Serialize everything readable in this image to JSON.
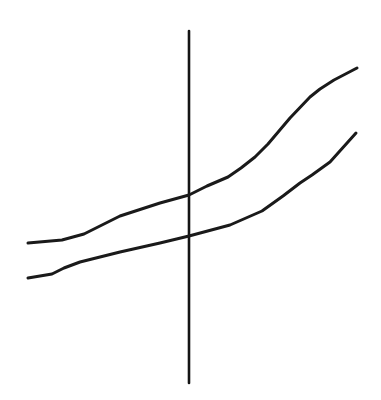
{
  "figure": {
    "background_color": "#ffffff",
    "width": 381,
    "height": 400
  },
  "chart_data": {
    "type": "line",
    "title": "",
    "subtitle": "",
    "xlabel": "",
    "ylabel": "",
    "xlim": [
      0,
      381
    ],
    "ylim": [
      400,
      0
    ],
    "grid": false,
    "legend": null,
    "annotations": [],
    "tick_labels": {
      "x": [],
      "y": []
    },
    "axes": [
      {
        "name": "vertical-axis",
        "orientation": "vertical",
        "x": 189,
        "y_start": 31,
        "y_end": 383,
        "color": "#141414",
        "width": 2.6
      }
    ],
    "series": [
      {
        "name": "upper-curve",
        "color": "#1a1a1a",
        "width": 3.0,
        "points": [
          [
            28,
            243
          ],
          [
            62,
            240
          ],
          [
            84,
            234
          ],
          [
            120,
            216
          ],
          [
            160,
            203
          ],
          [
            189,
            195
          ],
          [
            207,
            186
          ],
          [
            228,
            177
          ],
          [
            241,
            168
          ],
          [
            255,
            157
          ],
          [
            268,
            144
          ],
          [
            290,
            118
          ],
          [
            310,
            97
          ],
          [
            320,
            89
          ],
          [
            334,
            80
          ],
          [
            357,
            68
          ]
        ]
      },
      {
        "name": "lower-curve",
        "color": "#1a1a1a",
        "width": 3.0,
        "points": [
          [
            28,
            278
          ],
          [
            52,
            274
          ],
          [
            64,
            268
          ],
          [
            80,
            262
          ],
          [
            120,
            252
          ],
          [
            160,
            243
          ],
          [
            189,
            236
          ],
          [
            230,
            225
          ],
          [
            262,
            211
          ],
          [
            283,
            196
          ],
          [
            300,
            183
          ],
          [
            312,
            175
          ],
          [
            330,
            162
          ],
          [
            356,
            133
          ]
        ]
      }
    ]
  }
}
